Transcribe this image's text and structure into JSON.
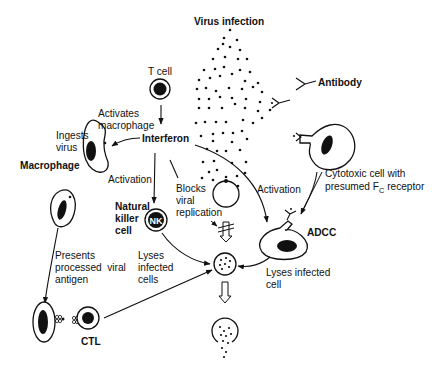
{
  "title": "Virus infection",
  "labels": {
    "virus_infection": "Virus infection",
    "antibody": "Antibody",
    "t_cell": "T cell",
    "activates_macrophage": "Activates\nmacrophage",
    "ingests_virus": "Ingests\nvirus",
    "macrophage": "Macrophage",
    "interferon": "Interferon",
    "activation_left": "Activation",
    "blocks_viral_replication": "Blocks\nviral\nreplication",
    "activation_right": "Activation",
    "natural_killer_cell": "Natural\nkiller\ncell",
    "nk": "NK",
    "cytotoxic_cell_line1": "Cytotoxic cell with",
    "cytotoxic_cell_line2_pre": "presumed F",
    "cytotoxic_cell_line2_sub": "C",
    "cytotoxic_cell_line2_post": " receptor",
    "adcc": "ADCC",
    "presents_processed_viral_antigen": "Presents\nprocessed  viral\nantigen",
    "lyses_infected_cells": "Lyses\ninfected\ncells",
    "lyses_infected_cell": "Lyses infected\ncell",
    "ctl": "CTL"
  },
  "colors": {
    "ink": "#111111",
    "background": "#ffffff"
  }
}
